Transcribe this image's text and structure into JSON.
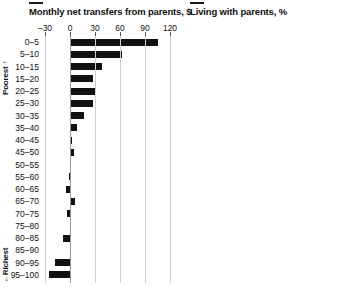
{
  "chart_data": [
    {
      "type": "bar",
      "orientation": "horizontal",
      "title": "Monthly net transfers from parents, $",
      "xlabel": "",
      "ylabel": "",
      "xlim": [
        -30,
        120
      ],
      "xticks": [
        -30,
        0,
        30,
        60,
        90,
        120
      ],
      "grid": true,
      "legend": null,
      "bar_color": "#111111",
      "categories": [
        "0–5",
        "5–10",
        "10–15",
        "15–20",
        "20–25",
        "25–30",
        "30–35",
        "35–40",
        "40–45",
        "45–50",
        "50–55",
        "55–60",
        "60–65",
        "65–70",
        "70–75",
        "75–80",
        "80–85",
        "85–90",
        "90–95",
        "95–100"
      ],
      "values": [
        105,
        62,
        38,
        27,
        30,
        28,
        17,
        8,
        2,
        5,
        0,
        -1,
        -5,
        6,
        -4,
        0,
        -9,
        1,
        -18,
        -25
      ],
      "annotations": [
        "Poorest ↑",
        "← Richest"
      ]
    },
    {
      "type": "bar",
      "orientation": "horizontal",
      "title": "Living with parents, %",
      "xlabel": "",
      "ylabel": "",
      "xlim": [
        0,
        4
      ],
      "xticks": [
        0,
        1,
        2,
        3,
        4
      ],
      "grid": true,
      "legend": null,
      "bar_color": "#111111",
      "categories": [
        "0–5",
        "5–10",
        "10–15",
        "15–20",
        "20–25",
        "25–30",
        "30–35",
        "35–40",
        "40–45",
        "45–50",
        "50–55",
        "55–60",
        "60–65",
        "65–70",
        "70–75",
        "75–80",
        "80–85",
        "85–90",
        "90–95",
        "95–100"
      ],
      "values": [
        3.62,
        2.02,
        1.52,
        1.02,
        0.88,
        0.52,
        0.08,
        0.08,
        0.0,
        0.0,
        0.0,
        0.0,
        0.1,
        0.09,
        0.1,
        0.28,
        0.38,
        0.5,
        0.62,
        0.95
      ]
    }
  ],
  "panels": {
    "left": {
      "title": "Monthly net transfers from parents, $",
      "tick_labels": [
        "–30",
        "0",
        "30",
        "60",
        "90",
        "120"
      ],
      "poorest_label": "Poorest ↑",
      "richest_label": "←Richest"
    },
    "right": {
      "title": "Living with parents, %",
      "tick_labels": [
        "0",
        "1",
        "2",
        "3",
        "4"
      ]
    }
  }
}
